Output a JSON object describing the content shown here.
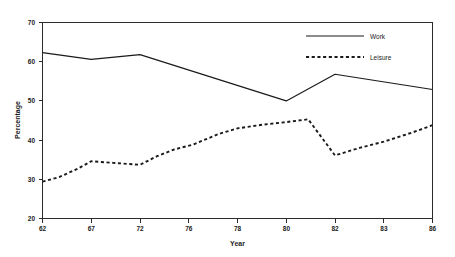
{
  "chart_data": {
    "type": "line",
    "title": "",
    "xlabel": "Year",
    "ylabel": "Percentage",
    "xlim": [
      0,
      8
    ],
    "ylim": [
      20,
      70
    ],
    "yticks": [
      20,
      30,
      40,
      50,
      60,
      70
    ],
    "categories": [
      "62",
      "67",
      "72",
      "76",
      "78",
      "80",
      "82",
      "83",
      "86"
    ],
    "grid": false,
    "legend_position": "top-right",
    "series": [
      {
        "name": "Work",
        "style": "solid",
        "color": "#1a1a1a",
        "x": [
          0,
          1,
          2,
          5,
          6,
          8
        ],
        "x_labels": [
          "62",
          "67",
          "72",
          "80",
          "82",
          "86"
        ],
        "values": [
          62.3,
          60.6,
          61.8,
          50.0,
          56.8,
          52.9
        ]
      },
      {
        "name": "Leisure",
        "style": "dashed",
        "color": "#1a1a1a",
        "x": [
          0,
          0.35,
          0.72,
          1.0,
          1.45,
          2.0,
          2.35,
          2.7,
          3.1,
          3.6,
          4.0,
          4.5,
          5.0,
          5.45,
          6.0,
          6.5,
          7.0,
          7.6,
          8.0
        ],
        "values": [
          29.4,
          30.6,
          32.7,
          34.6,
          34.2,
          33.7,
          35.9,
          37.6,
          38.9,
          41.5,
          43.0,
          43.9,
          44.6,
          45.3,
          36.1,
          38.0,
          39.6,
          42.0,
          43.8
        ]
      }
    ],
    "legend": [
      {
        "label": "Work",
        "style": "solid"
      },
      {
        "label": "Leisure",
        "style": "dashed"
      }
    ]
  },
  "axis": {
    "y_tick_labels": [
      "70",
      "60",
      "50",
      "40",
      "30",
      "20"
    ],
    "x_tick_labels": [
      "62",
      "67",
      "72",
      "76",
      "78",
      "80",
      "82",
      "83",
      "86"
    ],
    "y_title": "Percentage",
    "x_title": "Year"
  }
}
